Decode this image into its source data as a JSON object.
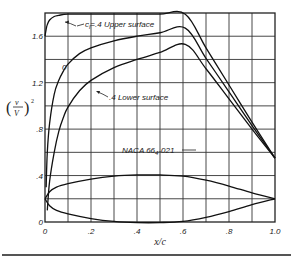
{
  "chart_data": {
    "type": "line",
    "title": "",
    "xlabel": "x/c",
    "ylabel": "(v/V)²",
    "xlim": [
      0,
      1.0
    ],
    "ylim": [
      0,
      1.8
    ],
    "grid": true,
    "x_ticks": [
      "0",
      ".2",
      ".4",
      ".6",
      ".8",
      "1.0"
    ],
    "y_ticks": [
      "0",
      ".4",
      ".8",
      "1.2",
      "1.6"
    ],
    "annotations": {
      "upper": "c",
      "upper_sub": "l",
      "upper_rest": "=.4 Upper surface",
      "zero": "0",
      "lower": ".4 Lower surface",
      "airfoil": "NACA 66",
      "airfoil_sub": "4",
      "airfoil_rest": "-021"
    },
    "series": [
      {
        "name": "cl=.4 Upper surface",
        "x": [
          0,
          0.005,
          0.01,
          0.02,
          0.04,
          0.06,
          0.1,
          0.2,
          0.3,
          0.4,
          0.5,
          0.61,
          0.7,
          0.8,
          0.9,
          1.0
        ],
        "y": [
          1.6,
          1.66,
          1.7,
          1.74,
          1.77,
          1.78,
          1.79,
          1.79,
          1.79,
          1.79,
          1.79,
          1.79,
          1.5,
          1.18,
          0.86,
          0.55
        ]
      },
      {
        "name": "cl=0",
        "x": [
          0.005,
          0.01,
          0.02,
          0.04,
          0.06,
          0.08,
          0.1,
          0.15,
          0.2,
          0.3,
          0.4,
          0.5,
          0.61,
          0.7,
          0.8,
          0.9,
          1.0
        ],
        "y": [
          0.3,
          0.6,
          0.85,
          1.1,
          1.22,
          1.3,
          1.36,
          1.45,
          1.5,
          1.56,
          1.6,
          1.63,
          1.67,
          1.41,
          1.12,
          0.83,
          0.55
        ]
      },
      {
        "name": "cl=.4 Lower surface",
        "x": [
          0.01,
          0.02,
          0.04,
          0.06,
          0.08,
          0.1,
          0.15,
          0.2,
          0.3,
          0.4,
          0.5,
          0.61,
          0.7,
          0.8,
          0.9,
          1.0
        ],
        "y": [
          0.1,
          0.35,
          0.6,
          0.78,
          0.9,
          0.99,
          1.13,
          1.22,
          1.33,
          1.4,
          1.46,
          1.53,
          1.32,
          1.06,
          0.8,
          0.55
        ]
      },
      {
        "name": "NACA 66-021 section (upper contour)",
        "x": [
          0,
          0.02,
          0.05,
          0.1,
          0.2,
          0.3,
          0.4,
          0.5,
          0.6,
          0.7,
          0.8,
          0.9,
          1.0
        ],
        "y": [
          0.2,
          0.26,
          0.3,
          0.33,
          0.37,
          0.395,
          0.405,
          0.405,
          0.395,
          0.36,
          0.31,
          0.25,
          0.2
        ]
      },
      {
        "name": "NACA 66-021 section (lower contour)",
        "x": [
          0,
          0.02,
          0.05,
          0.1,
          0.2,
          0.3,
          0.4,
          0.5,
          0.6,
          0.7,
          0.8,
          0.9,
          1.0
        ],
        "y": [
          0.2,
          0.14,
          0.1,
          0.07,
          0.03,
          0.005,
          -0.005,
          -0.005,
          0.005,
          0.04,
          0.09,
          0.15,
          0.2
        ]
      }
    ]
  }
}
